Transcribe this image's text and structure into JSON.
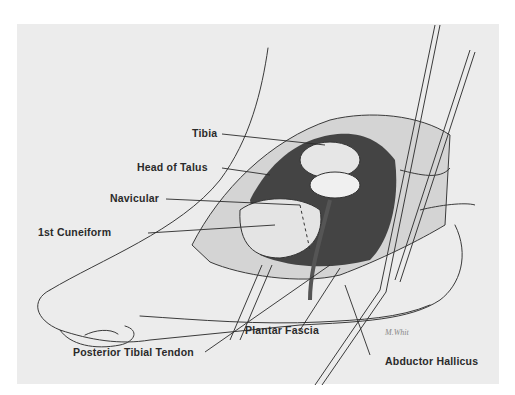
{
  "figure": {
    "labels": [
      {
        "id": "tibia",
        "text": "Tibia"
      },
      {
        "id": "head-of-talus",
        "text": "Head of Talus"
      },
      {
        "id": "navicular",
        "text": "Navicular"
      },
      {
        "id": "first-cuneiform",
        "text": "1st Cuneiform"
      },
      {
        "id": "posterior-tibial-tendon",
        "text": "Posterior Tibial Tendon"
      },
      {
        "id": "plantar-fascia",
        "text": "Plantar Fascia"
      },
      {
        "id": "abductor-hallicus",
        "text": "Abductor Hallicus"
      }
    ],
    "signature": "M.Whit"
  },
  "colors": {
    "background": "#ececec",
    "line": "#3a3a3a",
    "shadow": "#1e1e1e",
    "text": "#2a2a2a"
  }
}
